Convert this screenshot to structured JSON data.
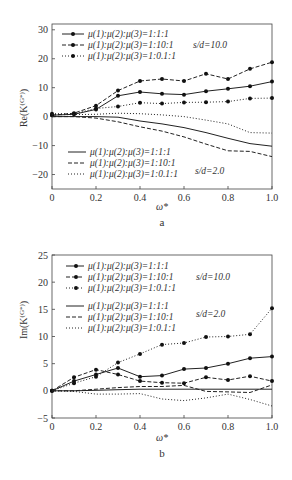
{
  "chart_data": [
    {
      "type": "line",
      "panel": "a",
      "caption": "a",
      "xlabel": "ω*",
      "ylabel": "Re(K_y^(G*))",
      "xlim": [
        0,
        1.0
      ],
      "ylim": [
        -25,
        32
      ],
      "x_ticks": [
        "0",
        "0.2",
        "0.4",
        "0.6",
        "0.8",
        "1.0"
      ],
      "y_ticks": [
        "30",
        "20",
        "10",
        "0",
        "−10",
        "−20"
      ],
      "x": [
        0,
        0.1,
        0.2,
        0.3,
        0.4,
        0.5,
        0.6,
        0.7,
        0.8,
        0.9,
        1.0
      ],
      "legend_groups": [
        {
          "label": "s/d=10.0",
          "entries": [
            "μ(1):μ(2):μ(3)=1:1:1",
            "μ(1):μ(2):μ(3)=1:10:1",
            "μ(1):μ(2):μ(3)=1:0.1:1"
          ]
        },
        {
          "label": "s/d=2.0",
          "entries": [
            "μ(1):μ(2):μ(3)=1:1:1",
            "μ(1):μ(2):μ(3)=1:10:1",
            "μ(1):μ(2):μ(3)=1:0.1:1"
          ]
        }
      ],
      "series": [
        {
          "name": "1:1:1, s/d=10.0",
          "style": "solid",
          "markers": true,
          "values": [
            0.5,
            0.8,
            2.5,
            7.2,
            8.5,
            7.9,
            7.6,
            8.8,
            9.6,
            10.5,
            12.1
          ]
        },
        {
          "name": "1:10:1, s/d=10.0",
          "style": "dashed",
          "markers": true,
          "values": [
            0.5,
            1.2,
            3.8,
            9.0,
            12.3,
            13.0,
            12.3,
            14.8,
            13.0,
            16.5,
            18.8
          ]
        },
        {
          "name": "1:0.1:1, s/d=10.0",
          "style": "dotted",
          "markers": true,
          "values": [
            1.0,
            1.0,
            2.8,
            3.5,
            4.8,
            4.5,
            4.9,
            5.0,
            5.2,
            6.3,
            6.4
          ]
        },
        {
          "name": "1:1:1, s/d=2.0",
          "style": "solid",
          "markers": false,
          "values": [
            0,
            0,
            0,
            -0.2,
            -1.5,
            -2.5,
            -3.8,
            -5.5,
            -7.5,
            -9.3,
            -10.2
          ]
        },
        {
          "name": "1:10:1, s/d=2.0",
          "style": "dashed",
          "markers": false,
          "values": [
            0,
            0,
            -0.5,
            -1.8,
            -3.5,
            -5.0,
            -7.0,
            -9.5,
            -11.8,
            -12.0,
            -13.8
          ]
        },
        {
          "name": "1:0.1:1, s/d=2.0",
          "style": "dotted",
          "markers": false,
          "values": [
            0.7,
            0.7,
            0.8,
            1.2,
            1.0,
            0.6,
            0,
            -1.2,
            -2.5,
            -5.5,
            -5.7
          ]
        }
      ]
    },
    {
      "type": "line",
      "panel": "b",
      "caption": "b",
      "xlabel": "ω*",
      "ylabel": "Im(K_y^(G*))",
      "xlim": [
        0,
        1.0
      ],
      "ylim": [
        -5,
        25
      ],
      "x_ticks": [
        "0",
        "0.2",
        "0.4",
        "0.6",
        "0.8",
        "1.0"
      ],
      "y_ticks": [
        "25",
        "20",
        "15",
        "10",
        "5",
        "0",
        "−5"
      ],
      "x": [
        0,
        0.1,
        0.2,
        0.3,
        0.4,
        0.5,
        0.6,
        0.7,
        0.8,
        0.9,
        1.0
      ],
      "legend_groups": [
        {
          "label": "s/d=10.0",
          "entries": [
            "μ(1):μ(2):μ(3)=1:1:1",
            "μ(1):μ(2):μ(3)=1:10:1",
            "μ(1):μ(2):μ(3)=1:0.1:1"
          ]
        },
        {
          "label": "s/d=2.0",
          "entries": [
            "μ(1):μ(2):μ(3)=1:1:1",
            "μ(1):μ(2):μ(3)=1:10:1",
            "μ(1):μ(2):μ(3)=1:0.1:1"
          ]
        }
      ],
      "series": [
        {
          "name": "1:1:1, s/d=10.0",
          "style": "solid",
          "markers": true,
          "values": [
            0,
            1.8,
            3.0,
            4.2,
            2.6,
            2.8,
            4.0,
            4.2,
            5.0,
            6.0,
            6.3
          ]
        },
        {
          "name": "1:10:1, s/d=10.0",
          "style": "dashed",
          "markers": true,
          "values": [
            0,
            2.5,
            3.9,
            3.0,
            1.8,
            1.5,
            1.4,
            2.5,
            2.0,
            2.7,
            1.8
          ]
        },
        {
          "name": "1:0.1:1, s/d=10.0",
          "style": "dotted",
          "markers": true,
          "values": [
            0,
            1.4,
            2.6,
            5.2,
            6.8,
            8.5,
            8.8,
            9.9,
            10.0,
            10.4,
            15.2
          ]
        },
        {
          "name": "1:1:1, s/d=2.0",
          "style": "solid",
          "markers": false,
          "values": [
            0,
            0,
            0.1,
            0.2,
            0.3,
            0.3,
            0.3,
            0.3,
            0.3,
            0.3,
            0.3
          ]
        },
        {
          "name": "1:10:1, s/d=2.0",
          "style": "dashed",
          "markers": false,
          "values": [
            0,
            0,
            0.3,
            0.6,
            0.8,
            0.8,
            1.0,
            -0.1,
            -0.2,
            -0.3,
            1.1
          ]
        },
        {
          "name": "1:0.1:1, s/d=2.0",
          "style": "dotted",
          "markers": false,
          "values": [
            0,
            -0.1,
            -0.6,
            -0.6,
            -0.5,
            -1.5,
            -1.8,
            -1.3,
            -0.6,
            -1.6,
            -2.8
          ]
        }
      ]
    }
  ],
  "panels": {
    "a": {
      "ylabel": "Re(K",
      "ylabel_sup": "(G*)",
      "ylabel_sub": "y",
      "ylabel_close": ")",
      "xlabel": "ω*",
      "caption": "a",
      "legend_top": {
        "l1": "μ(1):μ(2):μ(3)=1:1:1",
        "l2": "μ(1):μ(2):μ(3)=1:10:1",
        "l3": "μ(1):μ(2):μ(3)=1:0.1:1",
        "sd": "s/d=10.0"
      },
      "legend_bottom": {
        "l1": "μ(1):μ(2):μ(3)=1:1:1",
        "l2": "μ(1):μ(2):μ(3)=1:10:1",
        "l3": "μ(1):μ(2):μ(3)=1:0.1:1",
        "sd": "s/d=2.0"
      }
    },
    "b": {
      "ylabel": "Im(K",
      "ylabel_sup": "(G*)",
      "ylabel_sub": "y",
      "ylabel_close": ")",
      "xlabel": "ω*",
      "caption": "b",
      "legend_top": {
        "l1": "μ(1):μ(2):μ(3)=1:1:1",
        "l2": "μ(1):μ(2):μ(3)=1:10:1",
        "l3": "μ(1):μ(2):μ(3)=1:0.1:1",
        "sd": "s/d=10.0"
      },
      "legend_bottom": {
        "l1": "μ(1):μ(2):μ(3)=1:1:1",
        "l2": "μ(1):μ(2):μ(3)=1:10:1",
        "l3": "μ(1):μ(2):μ(3)=1:0.1:1",
        "sd": "s/d=2.0"
      }
    }
  }
}
